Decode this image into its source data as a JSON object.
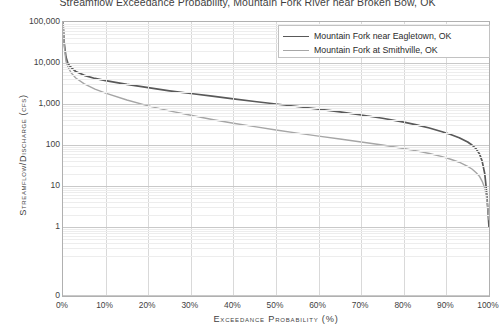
{
  "chart_data": {
    "type": "line",
    "title": "Streamflow Exceedance Probability, Mountain Fork River near Broken Bow, OK",
    "xlabel": "Exceedance Probability  (%)",
    "ylabel": "Streamflow/Discharge  (cfs)",
    "yscale": "log",
    "ylim": [
      1,
      100000
    ],
    "xlim": [
      0,
      100
    ],
    "grid": true,
    "legend_position": "top-right",
    "x_ticks": [
      "0%",
      "10%",
      "20%",
      "30%",
      "40%",
      "50%",
      "60%",
      "70%",
      "80%",
      "90%",
      "100%"
    ],
    "x_tick_values": [
      0,
      10,
      20,
      30,
      40,
      50,
      60,
      70,
      80,
      90,
      100
    ],
    "y_ticks": [
      "100,000",
      "10,000",
      "1,000",
      "100",
      "10",
      "1",
      "0"
    ],
    "y_tick_values": [
      100000,
      10000,
      1000,
      100,
      10,
      1,
      0
    ],
    "series": [
      {
        "name": "Mountain Fork near Eagletown, OK",
        "color": "#595959",
        "x": [
          0,
          0.3,
          0.7,
          1.2,
          2,
          3,
          5,
          7.5,
          10,
          15,
          20,
          25,
          30,
          35,
          40,
          45,
          50,
          55,
          60,
          65,
          70,
          75,
          80,
          83,
          86,
          89,
          91,
          93,
          95,
          96,
          97,
          97.8,
          98.4,
          99,
          99.4,
          99.7,
          100
        ],
        "y": [
          100000,
          30000,
          14000,
          9500,
          7600,
          6200,
          5000,
          4200,
          3700,
          3000,
          2500,
          2100,
          1800,
          1550,
          1330,
          1150,
          1000,
          870,
          750,
          640,
          540,
          450,
          360,
          310,
          260,
          210,
          180,
          150,
          118,
          100,
          80,
          60,
          40,
          20,
          8,
          3,
          1
        ]
      },
      {
        "name": "Mountain Fork at Smithville, OK",
        "color": "#a6a6a6",
        "x": [
          0,
          0.3,
          0.7,
          1.2,
          2,
          3,
          5,
          7.5,
          10,
          15,
          20,
          25,
          30,
          35,
          40,
          45,
          50,
          55,
          60,
          65,
          70,
          75,
          80,
          83,
          86,
          89,
          91,
          93,
          95,
          96,
          97,
          97.8,
          98.4,
          99,
          99.4,
          99.7,
          100
        ],
        "y": [
          100000,
          26000,
          11000,
          7800,
          5600,
          4300,
          3100,
          2300,
          1850,
          1250,
          900,
          680,
          530,
          420,
          340,
          280,
          232,
          195,
          165,
          140,
          118,
          100,
          82,
          72,
          62,
          52,
          45,
          38,
          30,
          26,
          21,
          17,
          13,
          9,
          5.5,
          3,
          1.5
        ]
      }
    ]
  },
  "axes": {
    "y_title": "Streamflow/Discharge  (cfs)",
    "x_title": "Exceedance Probability  (%)"
  },
  "legend": {
    "items": [
      {
        "label": "Mountain Fork near Eagletown, OK",
        "color": "#595959"
      },
      {
        "label": "Mountain Fork at Smithville, OK",
        "color": "#a6a6a6"
      }
    ]
  },
  "colors": {
    "series_dark": "#595959",
    "series_light": "#a6a6a6",
    "grid_major": "#c9c9c9",
    "grid_minor": "#ededed",
    "frame": "#b0b0b0",
    "text": "#3f3f3f"
  }
}
